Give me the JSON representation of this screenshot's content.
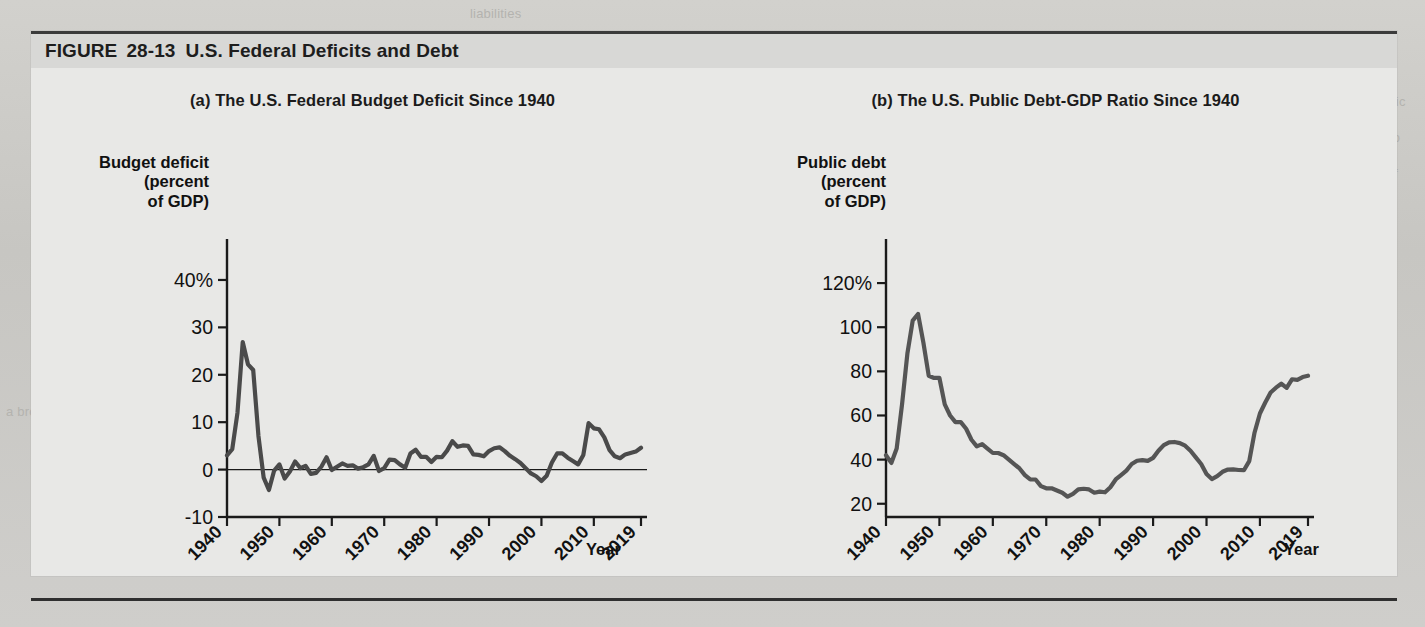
{
  "figure": {
    "label": "FIGURE",
    "number": "28-13",
    "title": "U.S. Federal Deficits and Debt"
  },
  "background_text": {
    "line1": "liabilities",
    "line2": "tion deficits are, in effect, IOUs from the public",
    "line3": "sector to the private sector. Because the ratio",
    "line4": "of debt to GDP is the most useful measure of",
    "line5": "the burden of debt, economists often track it",
    "line6": "over time as a share of GDP.",
    "line7": "a broad decline"
  },
  "panel_a": {
    "title": "(a) The U.S. Federal Budget Deficit Since 1940",
    "y_axis_label_lines": [
      "Budget deficit",
      "(percent",
      "of GDP)"
    ],
    "x_axis_label": "Year",
    "y_ticks": [
      "40%",
      "30",
      "20",
      "10",
      "0",
      "-10"
    ],
    "x_ticks": [
      "1940",
      "1950",
      "1960",
      "1970",
      "1980",
      "1990",
      "2000",
      "2010",
      "2019"
    ]
  },
  "panel_b": {
    "title": "(b) The U.S. Public Debt-GDP Ratio Since 1940",
    "y_axis_label_lines": [
      "Public debt",
      "(percent",
      "of GDP)"
    ],
    "x_axis_label": "Year",
    "y_ticks": [
      "120%",
      "100",
      "80",
      "60",
      "40",
      "20"
    ],
    "x_ticks": [
      "1940",
      "1950",
      "1960",
      "1970",
      "1980",
      "1990",
      "2000",
      "2010",
      "2019"
    ]
  },
  "chart_data": [
    {
      "type": "line",
      "panel": "a",
      "title": "(a) The U.S. Federal Budget Deficit Since 1940",
      "xlabel": "Year",
      "ylabel": "Budget deficit (percent of GDP)",
      "xlim": [
        1940,
        2019
      ],
      "ylim": [
        -10,
        44
      ],
      "yticks": [
        -10,
        0,
        10,
        20,
        30,
        40
      ],
      "ytick_labels": [
        "-10",
        "0",
        "10",
        "20",
        "30",
        "40%"
      ],
      "xticks": [
        1940,
        1950,
        1960,
        1970,
        1980,
        1990,
        2000,
        2010,
        2019
      ],
      "grid": false,
      "legend": "none",
      "zero_line": true,
      "line_color": "#4a4a4a",
      "series": [
        {
          "name": "Federal budget deficit (percent of GDP)",
          "x": [
            1940,
            1941,
            1942,
            1943,
            1944,
            1945,
            1946,
            1947,
            1948,
            1949,
            1950,
            1951,
            1952,
            1953,
            1954,
            1955,
            1956,
            1957,
            1958,
            1959,
            1960,
            1961,
            1962,
            1963,
            1964,
            1965,
            1966,
            1967,
            1968,
            1969,
            1970,
            1971,
            1972,
            1973,
            1974,
            1975,
            1976,
            1977,
            1978,
            1979,
            1980,
            1981,
            1982,
            1983,
            1984,
            1985,
            1986,
            1987,
            1988,
            1989,
            1990,
            1991,
            1992,
            1993,
            1994,
            1995,
            1996,
            1997,
            1998,
            1999,
            2000,
            2001,
            2002,
            2003,
            2004,
            2005,
            2006,
            2007,
            2008,
            2009,
            2010,
            2011,
            2012,
            2013,
            2014,
            2015,
            2016,
            2017,
            2018,
            2019
          ],
          "values": [
            3.0,
            4.3,
            12.0,
            26.9,
            22.2,
            21.0,
            7.1,
            -1.7,
            -4.3,
            -0.2,
            1.1,
            -1.9,
            -0.4,
            1.7,
            0.3,
            0.8,
            -0.9,
            -0.7,
            0.6,
            2.6,
            -0.1,
            0.6,
            1.3,
            0.8,
            0.9,
            0.2,
            0.5,
            1.1,
            2.9,
            -0.3,
            0.3,
            2.1,
            2.0,
            1.1,
            0.4,
            3.4,
            4.2,
            2.7,
            2.7,
            1.6,
            2.7,
            2.6,
            4.0,
            6.0,
            4.8,
            5.1,
            5.0,
            3.2,
            3.1,
            2.8,
            3.9,
            4.5,
            4.7,
            3.9,
            2.9,
            2.2,
            1.4,
            0.3,
            -0.8,
            -1.4,
            -2.4,
            -1.3,
            1.5,
            3.4,
            3.4,
            2.5,
            1.8,
            1.1,
            3.1,
            9.8,
            8.7,
            8.5,
            6.8,
            4.1,
            2.8,
            2.4,
            3.2,
            3.5,
            3.8,
            4.6
          ]
        }
      ]
    },
    {
      "type": "line",
      "panel": "b",
      "title": "(b) The U.S. Public Debt-GDP Ratio Since 1940",
      "xlabel": "Year",
      "ylabel": "Public debt (percent of GDP)",
      "xlim": [
        1940,
        2019
      ],
      "ylim": [
        14,
        130
      ],
      "yticks": [
        20,
        40,
        60,
        80,
        100,
        120
      ],
      "ytick_labels": [
        "20",
        "40",
        "60",
        "80",
        "100",
        "120%"
      ],
      "xticks": [
        1940,
        1950,
        1960,
        1970,
        1980,
        1990,
        2000,
        2010,
        2019
      ],
      "grid": false,
      "legend": "none",
      "zero_line": false,
      "line_color": "#555555",
      "series": [
        {
          "name": "Public debt as percent of GDP",
          "x": [
            1940,
            1941,
            1942,
            1943,
            1944,
            1945,
            1946,
            1947,
            1948,
            1949,
            1950,
            1951,
            1952,
            1953,
            1954,
            1955,
            1956,
            1957,
            1958,
            1959,
            1960,
            1961,
            1962,
            1963,
            1964,
            1965,
            1966,
            1967,
            1968,
            1969,
            1970,
            1971,
            1972,
            1973,
            1974,
            1975,
            1976,
            1977,
            1978,
            1979,
            1980,
            1981,
            1982,
            1983,
            1984,
            1985,
            1986,
            1987,
            1988,
            1989,
            1990,
            1991,
            1992,
            1993,
            1994,
            1995,
            1996,
            1997,
            1998,
            1999,
            2000,
            2001,
            2002,
            2003,
            2004,
            2005,
            2006,
            2007,
            2008,
            2009,
            2010,
            2011,
            2012,
            2013,
            2014,
            2015,
            2016,
            2017,
            2018,
            2019
          ],
          "values": [
            42.0,
            38.5,
            45.0,
            65.0,
            88.0,
            103.0,
            106.0,
            93.0,
            78.0,
            77.0,
            77.0,
            65.0,
            60.0,
            57.0,
            57.0,
            54.0,
            49.0,
            46.0,
            47.0,
            45.0,
            43.0,
            43.0,
            42.0,
            40.0,
            38.0,
            36.0,
            33.0,
            31.0,
            31.0,
            28.0,
            27.0,
            27.0,
            26.0,
            25.0,
            23.2,
            24.5,
            26.5,
            26.8,
            26.5,
            25.0,
            25.5,
            25.2,
            27.5,
            31.0,
            33.0,
            35.0,
            38.0,
            39.5,
            39.8,
            39.4,
            40.8,
            44.0,
            46.6,
            47.8,
            48.0,
            47.5,
            46.3,
            44.0,
            41.0,
            38.0,
            33.5,
            31.2,
            32.5,
            34.5,
            35.5,
            35.6,
            35.3,
            35.2,
            39.3,
            52.3,
            60.9,
            65.9,
            70.4,
            72.6,
            74.4,
            72.5,
            76.4,
            76.1,
            77.4,
            78.0
          ]
        }
      ]
    }
  ]
}
